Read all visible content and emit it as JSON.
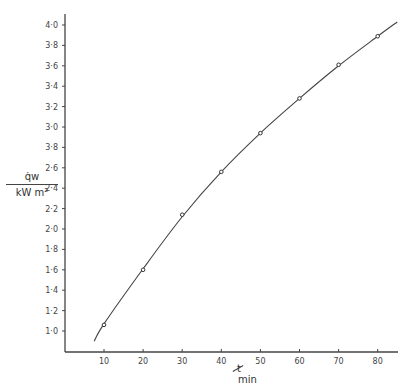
{
  "chart_data": {
    "type": "line",
    "title": "",
    "xlabel": "t / min",
    "ylabel": "q̇w / kW m^-2",
    "x_ticks": [
      "10",
      "20",
      "30",
      "40",
      "50",
      "60",
      "70",
      "80"
    ],
    "y_ticks": [
      "1·0",
      "1·2",
      "1·4",
      "1·6",
      "1·8",
      "2·0",
      "2·2",
      "2·4",
      "2·6",
      "3·8",
      "3·0",
      "3·2",
      "3·4",
      "3·6",
      "3·8",
      "4·0"
    ],
    "xlim": [
      0,
      85
    ],
    "ylim": [
      0.8,
      4.1
    ],
    "grid": false,
    "legend": null,
    "series": [
      {
        "name": "measured",
        "marker": "circle",
        "x": [
          10,
          20,
          30,
          40,
          50,
          60,
          70,
          80
        ],
        "values": [
          1.06,
          1.6,
          2.14,
          2.56,
          2.94,
          3.28,
          3.61,
          3.89
        ]
      },
      {
        "name": "fitted curve",
        "marker": "none",
        "x": [
          7.5,
          10,
          20,
          30,
          40,
          50,
          60,
          70,
          80,
          85
        ],
        "values": [
          0.9,
          1.07,
          1.61,
          2.12,
          2.56,
          2.94,
          3.28,
          3.6,
          3.89,
          4.03
        ]
      }
    ]
  },
  "labels": {
    "y_num": "q̇w",
    "y_den": "kW m²",
    "x_var": "t",
    "x_unit": "min"
  }
}
